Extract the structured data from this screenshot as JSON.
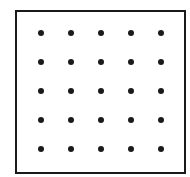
{
  "diagram": {
    "type": "dot-grid",
    "rows": 5,
    "columns": 5,
    "dot_color": "#1a1a1a",
    "border_color": "#1a1a1a",
    "background_color": "#ffffff",
    "column_positions_px": [
      41,
      71,
      101,
      131,
      161
    ],
    "row_positions_px": [
      33,
      62,
      91,
      120,
      149
    ]
  }
}
